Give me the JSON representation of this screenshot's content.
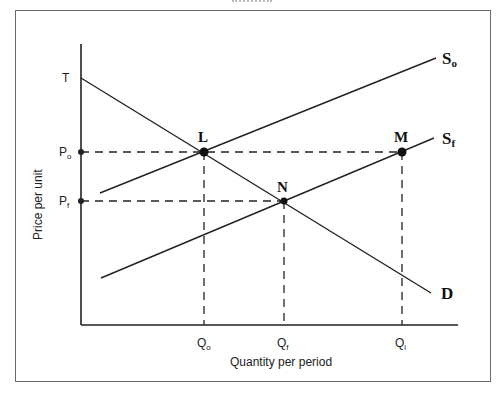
{
  "diagram": {
    "type": "supply-demand",
    "axes": {
      "y_label": "Price per unit",
      "x_label": "Quantity per period",
      "y_ticks": [
        {
          "label": "T",
          "sub": ""
        },
        {
          "label": "P",
          "sub": "o"
        },
        {
          "label": "P",
          "sub": "f"
        }
      ],
      "x_ticks": [
        {
          "label": "Q",
          "sub": "o"
        },
        {
          "label": "Q",
          "sub": "f"
        },
        {
          "label": "Q",
          "sub": "i"
        }
      ]
    },
    "curves": {
      "supply_original": {
        "label": "S",
        "sub": "o"
      },
      "supply_final": {
        "label": "S",
        "sub": "f"
      },
      "demand": {
        "label": "D"
      }
    },
    "points": {
      "L": "L",
      "M": "M",
      "N": "N"
    }
  }
}
